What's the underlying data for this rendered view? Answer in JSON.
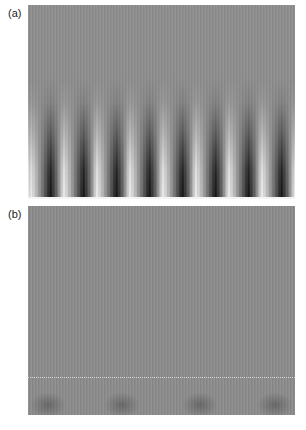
{
  "figure": {
    "panels": [
      {
        "label": "(a)",
        "description": "Grayscale field with 8 periodic dark/bright vertical fringes decaying upward from bottom boundary",
        "background_color": "#8e8e8e",
        "fringe_count": 8,
        "fringe_period_px": 33,
        "fringe_start_px": 6
      },
      {
        "label": "(b)",
        "description": "Uniform gray field with a faint dotted horizontal line near bottom and weak periodic dark patches at bottom",
        "background_color": "#8c8c8c",
        "bottom_patch_count": 4
      }
    ]
  }
}
